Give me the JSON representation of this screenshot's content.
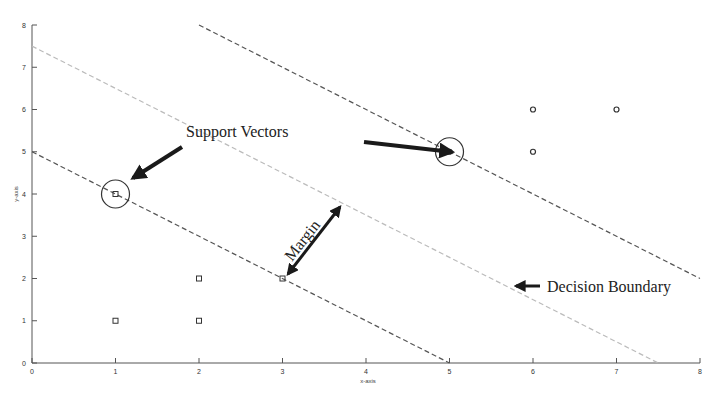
{
  "chart_data": {
    "type": "scatter",
    "title": "",
    "xlabel": "x-axis",
    "ylabel": "y-axis",
    "xlim": [
      0,
      8
    ],
    "ylim": [
      0,
      8
    ],
    "grid": false,
    "x_ticks": [
      "0",
      "1",
      "2",
      "3",
      "4",
      "5",
      "6",
      "7",
      "8"
    ],
    "y_ticks": [
      "0",
      "1",
      "2",
      "3",
      "4",
      "5",
      "6",
      "7",
      "8"
    ],
    "series": [
      {
        "name": "class-square",
        "marker": "square",
        "points": [
          [
            1,
            1
          ],
          [
            2,
            1
          ],
          [
            2,
            2
          ],
          [
            3,
            2
          ],
          [
            1,
            4
          ]
        ]
      },
      {
        "name": "class-circle",
        "marker": "circle",
        "points": [
          [
            5,
            5
          ],
          [
            6,
            5
          ],
          [
            6,
            6
          ],
          [
            7,
            6
          ]
        ]
      }
    ],
    "lines": [
      {
        "name": "lower-margin",
        "style": "dashed",
        "color": "#555555",
        "from": [
          0,
          5
        ],
        "to": [
          5,
          0
        ]
      },
      {
        "name": "decision-boundary",
        "style": "dashed",
        "color": "#bbbbbb",
        "from": [
          0,
          7.5
        ],
        "to": [
          7.5,
          0
        ]
      },
      {
        "name": "upper-margin",
        "style": "dashed",
        "color": "#555555",
        "from": [
          2,
          8
        ],
        "to": [
          8,
          2
        ]
      }
    ],
    "support_vectors": [
      [
        1,
        4
      ],
      [
        3,
        2
      ],
      [
        5,
        5
      ]
    ],
    "annotations": [
      "Support Vectors",
      "Margin",
      "Decision Boundary"
    ]
  },
  "labels": {
    "support_vectors": "Support Vectors",
    "margin": "Margin",
    "decision_boundary": "Decision Boundary",
    "xlabel": "x-axis",
    "ylabel": "y-axis"
  }
}
